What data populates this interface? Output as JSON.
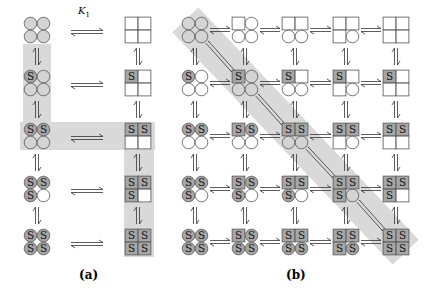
{
  "figure": {
    "panel_a": {
      "label": "(a)",
      "equilibrium_constant_label": "K",
      "equilibrium_constant_subscript": "1",
      "rows": [
        {
          "bound_S": 0,
          "left_state": "R (all circles)",
          "right_state": "T (all squares)"
        },
        {
          "bound_S": 1,
          "left_state": "R",
          "right_state": "T"
        },
        {
          "bound_S": 2,
          "left_state": "R",
          "right_state": "T"
        },
        {
          "bound_S": 3,
          "left_state": "R",
          "right_state": "T"
        },
        {
          "bound_S": 4,
          "left_state": "R",
          "right_state": "T"
        }
      ],
      "highlighted_path": "left column rows 0-2, across row 2, right column rows 2-4"
    },
    "panel_b": {
      "label": "(b)",
      "grid_rows": 5,
      "grid_cols": 5,
      "row_meaning": "number of bound substrate S (0-4)",
      "col_meaning": "number of subunits in square conformation (0-4)",
      "highlighted_path": "main diagonal (0,0) to (4,4)"
    },
    "substrate_letter": "S",
    "colors": {
      "highlight_band": "#d9d9d9",
      "bound_fill": "#a6a6a6",
      "stroke": "#555555",
      "empty_fill_circle_a": "#d4d4d4",
      "empty_fill": "#ffffff"
    }
  }
}
